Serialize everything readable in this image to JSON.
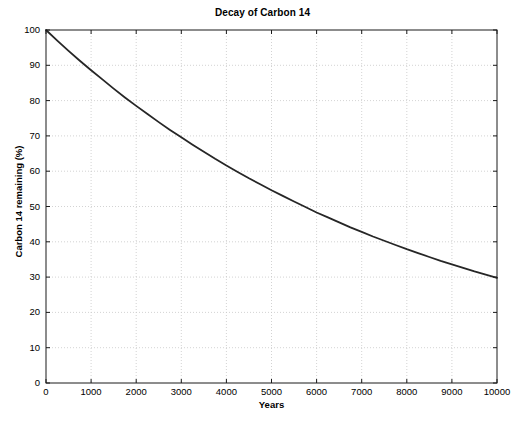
{
  "figure": {
    "background_color": "#ffffff",
    "plot_background_color": "#ffffff",
    "axis_color": "#1a1a1a",
    "grid_color": "#c8c8c8",
    "line_color": "#262626"
  },
  "chart_data": {
    "type": "line",
    "title": "Decay of Carbon 14",
    "xlabel": "Years",
    "ylabel": "Carbon 14 remaining (%)",
    "xlim": [
      0,
      10000
    ],
    "ylim": [
      0,
      100
    ],
    "grid": true,
    "grid_style": "dotted",
    "legend": null,
    "xticks": [
      0,
      1000,
      2000,
      3000,
      4000,
      5000,
      6000,
      7000,
      8000,
      9000,
      10000
    ],
    "xtick_labels": [
      "0",
      "1000",
      "2000",
      "3000",
      "4000",
      "5000",
      "6000",
      "7000",
      "8000",
      "9000",
      "10000"
    ],
    "yticks": [
      0,
      10,
      20,
      30,
      40,
      50,
      60,
      70,
      80,
      90,
      100
    ],
    "ytick_labels": [
      "0",
      "10",
      "20",
      "30",
      "40",
      "50",
      "60",
      "70",
      "80",
      "90",
      "100"
    ],
    "series": [
      {
        "name": "Carbon 14 remaining",
        "color": "#262626",
        "line_width": 1.8,
        "x": [
          0,
          250,
          500,
          750,
          1000,
          1250,
          1500,
          1750,
          2000,
          2250,
          2500,
          2750,
          3000,
          3250,
          3500,
          3750,
          4000,
          4250,
          4500,
          4750,
          5000,
          5250,
          5500,
          5730,
          6000,
          6250,
          6500,
          6750,
          7000,
          7250,
          7500,
          7750,
          8000,
          8250,
          8500,
          8750,
          9000,
          9250,
          9500,
          9750,
          10000
        ],
        "y": [
          100.0,
          97.0,
          94.1,
          91.3,
          88.6,
          86.0,
          83.4,
          80.9,
          78.5,
          76.2,
          73.9,
          71.7,
          69.6,
          67.5,
          65.5,
          63.5,
          61.6,
          59.8,
          58.0,
          56.3,
          54.6,
          53.0,
          51.4,
          50.0,
          48.3,
          46.9,
          45.5,
          44.1,
          42.8,
          41.5,
          40.3,
          39.1,
          37.9,
          36.8,
          35.7,
          34.6,
          33.6,
          32.6,
          31.6,
          30.7,
          29.8
        ]
      }
    ],
    "annotations": [],
    "model": {
      "description": "exponential decay",
      "initial_percent": 100,
      "half_life_years": 5730,
      "value_at_10000_years_percent": 29.8
    }
  }
}
